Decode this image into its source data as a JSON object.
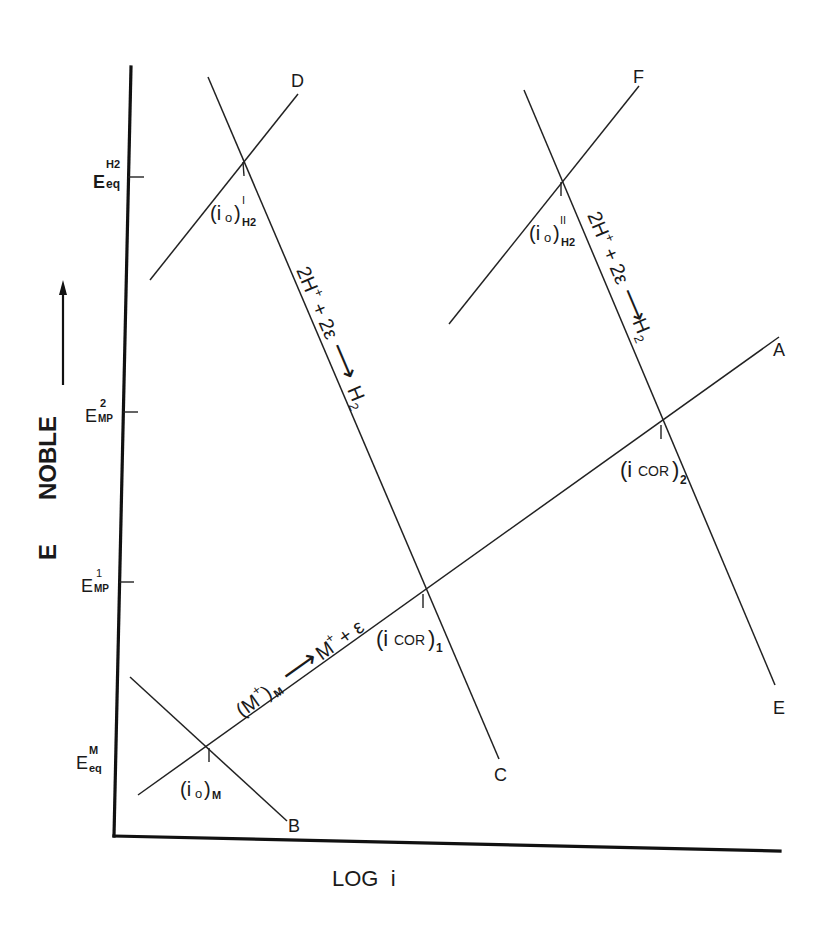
{
  "diagram": {
    "x_axis": {
      "label": "LOG  i"
    },
    "y_axis": {
      "label_e": "E",
      "label_noble": "NOBLE",
      "arrow": "up-arrow"
    },
    "y_ticks": [
      {
        "main": "E",
        "sup": "H2",
        "sub": "eq",
        "y": 177
      },
      {
        "main": "E",
        "sup": "2",
        "sub": "MP",
        "y": 412
      },
      {
        "main": "E",
        "sup": "1",
        "sub": "MP",
        "y": 582
      },
      {
        "main": "E",
        "sup": "M",
        "sub": "eq",
        "y": 758
      }
    ],
    "line_endpoints": {
      "A": "A",
      "B": "B",
      "C": "C",
      "D": "D",
      "E": "E",
      "F": "F"
    },
    "intersections": {
      "io_H2_1": {
        "base": "(i",
        "o": "o",
        "close": ")",
        "sup": "I",
        "sub": "H2"
      },
      "io_H2_2": {
        "base": "(i",
        "o": "o",
        "close": ")",
        "sup": "II",
        "sub": "H2"
      },
      "io_M": {
        "base": "(i",
        "o": "o",
        "close": ")",
        "sub": "M"
      },
      "icor_1": {
        "text": "(i",
        "sub_inline": "COR",
        "close": ")",
        "sub": "1"
      },
      "icor_2": {
        "text": "(i",
        "sub_inline": "COR",
        "close": ")",
        "sub": "2"
      }
    },
    "reactions": {
      "h2_left": {
        "lhs": "2H",
        "plus_sup": "+",
        "mid": " + 2ε",
        "arrow": "⟶",
        "rhs": "H",
        "rhs_sub": "2"
      },
      "h2_right": {
        "lhs": "2H",
        "plus_sup": "+",
        "mid": " + 2ε",
        "arrow": "⟶",
        "rhs": "H",
        "rhs_sub": "2"
      },
      "metal": {
        "lhs": "(M",
        "lhs_sup": "+",
        "lhs_close": ")",
        "lhs_sub": "M",
        "arrow": "⟶",
        "rhs": "M",
        "rhs_sup": "+",
        "rhs_tail": " + ε"
      }
    }
  }
}
